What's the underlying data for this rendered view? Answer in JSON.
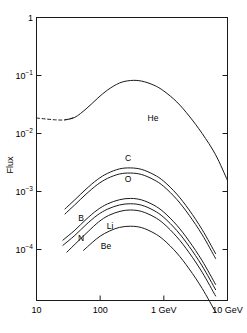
{
  "chart_data": {
    "type": "line",
    "title": "",
    "xlabel": "",
    "ylabel": "Flux",
    "xscale": "log",
    "yscale": "log",
    "xlim": [
      10,
      10000
    ],
    "ylim": [
      2e-05,
      1
    ],
    "grid": false,
    "legend": "inline-labels",
    "x_tick_labels": [
      "10",
      "100",
      "1 GeV",
      "10 GeV"
    ],
    "x_tick_values": [
      10,
      100,
      1000,
      10000
    ],
    "y_tick_labels": [
      "1",
      "10⁻¹",
      "10⁻²",
      "10⁻³",
      "10⁻⁴"
    ],
    "y_tick_values": [
      1,
      0.1,
      0.01,
      0.001,
      0.0001
    ],
    "series": [
      {
        "name": "He",
        "label": "He",
        "style": "solid-with-dashed-lead",
        "x": [
          10,
          14,
          20,
          28,
          40,
          60,
          90,
          130,
          200,
          300,
          450,
          700,
          1000,
          1600,
          2500,
          4000,
          6500,
          10000
        ],
        "y": [
          0.0185,
          0.0178,
          0.0172,
          0.0172,
          0.019,
          0.0265,
          0.04,
          0.056,
          0.074,
          0.082,
          0.08,
          0.068,
          0.054,
          0.035,
          0.02,
          0.01,
          0.0043,
          0.00155
        ],
        "dashed_x_range": [
          10,
          40
        ]
      },
      {
        "name": "C",
        "label": "C",
        "style": "solid",
        "x": [
          28,
          40,
          60,
          90,
          130,
          200,
          300,
          450,
          700,
          1000,
          1600,
          2500,
          4000,
          6500
        ],
        "y": [
          0.0005,
          0.00072,
          0.0011,
          0.0016,
          0.00205,
          0.00245,
          0.00255,
          0.0024,
          0.00195,
          0.0015,
          0.0009,
          0.00048,
          0.00022,
          8.5e-05
        ]
      },
      {
        "name": "O",
        "label": "O",
        "style": "solid",
        "x": [
          28,
          40,
          60,
          90,
          130,
          200,
          300,
          450,
          700,
          1000,
          1600,
          2500,
          4000,
          6500
        ],
        "y": [
          0.00041,
          0.00059,
          0.0009,
          0.00131,
          0.00168,
          0.002,
          0.00208,
          0.00196,
          0.00159,
          0.00122,
          0.00073,
          0.00039,
          0.00018,
          7e-05
        ]
      },
      {
        "name": "B",
        "label": "B",
        "style": "solid",
        "x": [
          26,
          40,
          60,
          90,
          130,
          200,
          300,
          450,
          700,
          1000,
          1600,
          2500,
          4000,
          6500
        ],
        "y": [
          0.000145,
          0.000215,
          0.00033,
          0.00048,
          0.00061,
          0.00072,
          0.00076,
          0.000715,
          0.00058,
          0.00044,
          0.000262,
          0.000139,
          6.4e-05,
          2.5e-05
        ]
      },
      {
        "name": "N",
        "label": "N",
        "style": "solid",
        "x": [
          26,
          40,
          60,
          90,
          130,
          200,
          300,
          450,
          700,
          1000,
          1600,
          2500,
          4000,
          6500
        ],
        "y": [
          0.000118,
          0.000175,
          0.000268,
          0.00039,
          0.000495,
          0.000585,
          0.000615,
          0.00058,
          0.00047,
          0.000357,
          0.000212,
          0.000113,
          5.2e-05,
          2.03e-05
        ]
      },
      {
        "name": "Li",
        "label": "Li",
        "style": "solid",
        "x": [
          30,
          45,
          65,
          95,
          135,
          205,
          300,
          450,
          700,
          1000,
          1600,
          2500,
          4000,
          6500
        ],
        "y": [
          9e-05,
          0.000139,
          0.000205,
          0.0003,
          0.000385,
          0.000455,
          0.00048,
          0.000452,
          0.000366,
          0.000278,
          0.000165,
          8.8e-05,
          4.05e-05,
          1.58e-05
        ]
      },
      {
        "name": "Be",
        "label": "Be",
        "style": "solid",
        "x": [
          55,
          75,
          100,
          140,
          200,
          300,
          450,
          700,
          1000,
          1600,
          2500,
          4000,
          6500
        ],
        "y": [
          9.7e-05,
          0.000132,
          0.00017,
          0.000208,
          0.00024,
          0.000252,
          0.000238,
          0.000192,
          0.000146,
          8.7e-05,
          4.63e-05,
          2.13e-05,
          8.3e-06
        ]
      }
    ],
    "annotations": [
      {
        "text": "He",
        "x_px": 153,
        "y_px": 121
      },
      {
        "text": "C",
        "x_px": 128,
        "y_px": 161
      },
      {
        "text": "O",
        "x_px": 128,
        "y_px": 182
      },
      {
        "text": "B",
        "x_px": 81,
        "y_px": 221
      },
      {
        "text": "N",
        "x_px": 81,
        "y_px": 241
      },
      {
        "text": "Li",
        "x_px": 110,
        "y_px": 229
      },
      {
        "text": "Be",
        "x_px": 106,
        "y_px": 249
      }
    ],
    "colors": {
      "curve": "#1a1a1a",
      "axis": "#1a1a1a",
      "background": "#ffffff"
    }
  },
  "axes": {
    "y_label": "Flux",
    "y_ticks": [
      {
        "base": "1",
        "exp": ""
      },
      {
        "base": "10",
        "exp": "−1"
      },
      {
        "base": "10",
        "exp": "−2"
      },
      {
        "base": "10",
        "exp": "−3"
      },
      {
        "base": "10",
        "exp": "−4"
      }
    ],
    "x_ticks": [
      "10",
      "100",
      "1 GeV",
      "10 GeV"
    ]
  }
}
